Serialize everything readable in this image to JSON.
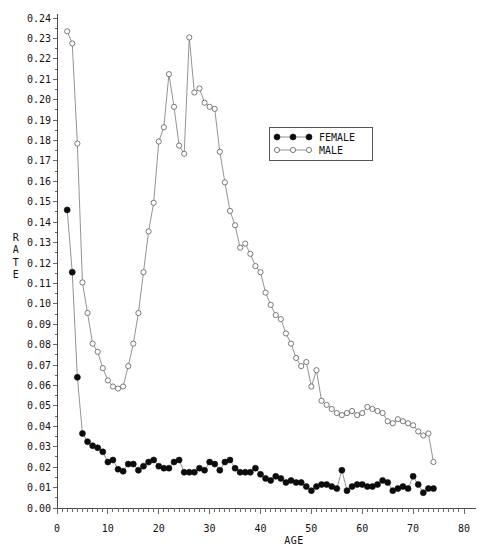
{
  "chart_data": {
    "type": "line",
    "title": "",
    "xlabel": "AGE",
    "ylabel": "RATE",
    "xlim": [
      0,
      80
    ],
    "ylim": [
      0.0,
      0.24
    ],
    "xticks": [
      0,
      10,
      20,
      30,
      40,
      50,
      60,
      70,
      80
    ],
    "yticks": [
      "0.00",
      "0.01",
      "0.02",
      "0.03",
      "0.04",
      "0.05",
      "0.06",
      "0.07",
      "0.08",
      "0.09",
      "0.10",
      "0.11",
      "0.12",
      "0.13",
      "0.14",
      "0.15",
      "0.16",
      "0.17",
      "0.18",
      "0.19",
      "0.20",
      "0.21",
      "0.22",
      "0.23",
      "0.24"
    ],
    "grid": false,
    "legend_position": "upper-right-inside",
    "series": [
      {
        "name": "FEMALE",
        "marker": "filled-circle",
        "color": "#0c0c0c",
        "x": [
          2,
          3,
          4,
          5,
          6,
          7,
          8,
          9,
          10,
          11,
          12,
          13,
          14,
          15,
          16,
          17,
          18,
          19,
          20,
          21,
          22,
          23,
          24,
          25,
          26,
          27,
          28,
          29,
          30,
          31,
          32,
          33,
          34,
          35,
          36,
          37,
          38,
          39,
          40,
          41,
          42,
          43,
          44,
          45,
          46,
          47,
          48,
          49,
          50,
          51,
          52,
          53,
          54,
          55,
          56,
          57,
          58,
          59,
          60,
          61,
          62,
          63,
          64,
          65,
          66,
          67,
          68,
          69,
          70,
          71,
          72,
          73,
          74
        ],
        "y": [
          0.146,
          0.1155,
          0.064,
          0.0365,
          0.0325,
          0.0305,
          0.0295,
          0.0275,
          0.0225,
          0.0235,
          0.019,
          0.018,
          0.0215,
          0.0215,
          0.0185,
          0.0205,
          0.0225,
          0.0235,
          0.0205,
          0.0195,
          0.0195,
          0.0225,
          0.0235,
          0.0175,
          0.0175,
          0.0175,
          0.0195,
          0.0185,
          0.0225,
          0.0215,
          0.0185,
          0.0225,
          0.0235,
          0.0195,
          0.0175,
          0.0175,
          0.0175,
          0.0195,
          0.0165,
          0.0145,
          0.0135,
          0.0155,
          0.0145,
          0.0125,
          0.0135,
          0.0125,
          0.0125,
          0.0105,
          0.0085,
          0.0105,
          0.0115,
          0.0115,
          0.0105,
          0.0095,
          0.0185,
          0.0085,
          0.0105,
          0.0115,
          0.0115,
          0.0105,
          0.0105,
          0.0115,
          0.0135,
          0.0125,
          0.0085,
          0.0095,
          0.0105,
          0.0095,
          0.0155,
          0.0115,
          0.0075,
          0.0095,
          0.0095
        ]
      },
      {
        "name": "MALE",
        "marker": "open-circle",
        "color": "#5a5a5a",
        "x": [
          2,
          3,
          4,
          5,
          6,
          7,
          8,
          9,
          10,
          11,
          12,
          13,
          14,
          15,
          16,
          17,
          18,
          19,
          20,
          21,
          22,
          23,
          24,
          25,
          26,
          27,
          28,
          29,
          30,
          31,
          32,
          33,
          34,
          35,
          36,
          37,
          38,
          39,
          40,
          41,
          42,
          43,
          44,
          45,
          46,
          47,
          48,
          49,
          50,
          51,
          52,
          53,
          54,
          55,
          56,
          57,
          58,
          59,
          60,
          61,
          62,
          63,
          64,
          65,
          66,
          67,
          68,
          69,
          70,
          71,
          72,
          73,
          74
        ],
        "y": [
          0.2335,
          0.2275,
          0.1785,
          0.1105,
          0.0955,
          0.0805,
          0.0765,
          0.0685,
          0.0625,
          0.0595,
          0.0585,
          0.0595,
          0.0695,
          0.0805,
          0.0955,
          0.1155,
          0.1355,
          0.1495,
          0.1795,
          0.1865,
          0.2125,
          0.1965,
          0.1775,
          0.1735,
          0.2305,
          0.2035,
          0.2055,
          0.1985,
          0.1965,
          0.1955,
          0.1745,
          0.1595,
          0.1455,
          0.1385,
          0.1275,
          0.1295,
          0.1245,
          0.1185,
          0.1155,
          0.1055,
          0.0995,
          0.0945,
          0.0925,
          0.0855,
          0.0805,
          0.0735,
          0.0695,
          0.0715,
          0.0595,
          0.0675,
          0.0525,
          0.0505,
          0.0485,
          0.0465,
          0.0455,
          0.0465,
          0.0475,
          0.0455,
          0.0465,
          0.0495,
          0.0485,
          0.0475,
          0.0465,
          0.0425,
          0.0415,
          0.0435,
          0.0425,
          0.0415,
          0.0405,
          0.0375,
          0.0355,
          0.0365,
          0.0225
        ]
      }
    ]
  },
  "legend": {
    "entries": [
      {
        "label": "FEMALE",
        "marker": "filled-circle"
      },
      {
        "label": "MALE",
        "marker": "open-circle"
      }
    ]
  },
  "axis": {
    "y_title_letters": [
      "R",
      "A",
      "T",
      "E"
    ],
    "x_title": "AGE"
  }
}
